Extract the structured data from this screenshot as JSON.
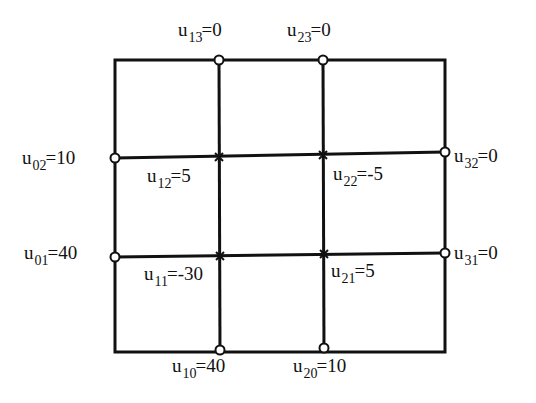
{
  "diagram": {
    "type": "finite-difference-grid",
    "grid": {
      "columns_x": [
        115,
        219,
        323,
        445
      ],
      "rows_y": [
        352,
        256,
        155,
        60
      ],
      "line_color": "#111111",
      "line_width": 3
    },
    "boundary_nodes": [
      {
        "id": "u13",
        "name": "u",
        "sub": "13",
        "value": "0",
        "i": 1,
        "j": 3,
        "marker": "open-circle"
      },
      {
        "id": "u23",
        "name": "u",
        "sub": "23",
        "value": "0",
        "i": 2,
        "j": 3,
        "marker": "open-circle"
      },
      {
        "id": "u02",
        "name": "u",
        "sub": "02",
        "value": "10",
        "i": 0,
        "j": 2,
        "marker": "open-circle"
      },
      {
        "id": "u32",
        "name": "u",
        "sub": "32",
        "value": "0",
        "i": 3,
        "j": 2,
        "marker": "open-circle"
      },
      {
        "id": "u01",
        "name": "u",
        "sub": "01",
        "value": "40",
        "i": 0,
        "j": 1,
        "marker": "open-circle"
      },
      {
        "id": "u31",
        "name": "u",
        "sub": "31",
        "value": "0",
        "i": 3,
        "j": 1,
        "marker": "open-circle"
      },
      {
        "id": "u10",
        "name": "u",
        "sub": "10",
        "value": "40",
        "i": 1,
        "j": 0,
        "marker": "open-circle"
      },
      {
        "id": "u20",
        "name": "u",
        "sub": "20",
        "value": "10",
        "i": 2,
        "j": 0,
        "marker": "open-circle"
      }
    ],
    "interior_nodes": [
      {
        "id": "u12",
        "name": "u",
        "sub": "12",
        "value": "5",
        "i": 1,
        "j": 2,
        "marker": "star"
      },
      {
        "id": "u22",
        "name": "u",
        "sub": "22",
        "value": "-5",
        "i": 2,
        "j": 2,
        "marker": "star"
      },
      {
        "id": "u11",
        "name": "u",
        "sub": "11",
        "value": "-30",
        "i": 1,
        "j": 1,
        "marker": "star"
      },
      {
        "id": "u21",
        "name": "u",
        "sub": "21",
        "value": "5",
        "i": 2,
        "j": 1,
        "marker": "star"
      }
    ],
    "labels": {
      "u13": {
        "u": "u",
        "sub": "13",
        "eq": "=0"
      },
      "u23": {
        "u": "u",
        "sub": "23",
        "eq": "=0"
      },
      "u02": {
        "u": "u",
        "sub": "02",
        "eq": "=10"
      },
      "u12": {
        "u": "u",
        "sub": "12",
        "eq": "=5"
      },
      "u22": {
        "u": "u",
        "sub": "22",
        "eq": "=-5"
      },
      "u32": {
        "u": "u",
        "sub": "32",
        "eq": "=0"
      },
      "u01": {
        "u": "u",
        "sub": "01",
        "eq": "=40"
      },
      "u11": {
        "u": "u",
        "sub": "11",
        "eq": "=-30"
      },
      "u21": {
        "u": "u",
        "sub": "21",
        "eq": "=5"
      },
      "u31": {
        "u": "u",
        "sub": "31",
        "eq": "=0"
      },
      "u10": {
        "u": "u",
        "sub": "10",
        "eq": "=40"
      },
      "u20": {
        "u": "u",
        "sub": "20",
        "eq": "=10"
      }
    }
  }
}
